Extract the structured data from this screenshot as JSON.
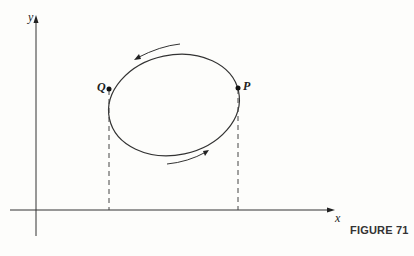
{
  "figure": {
    "caption": "FIGURE 71",
    "axes": {
      "x_label": "x",
      "y_label": "y"
    },
    "points": [
      {
        "name": "P",
        "label": "P"
      },
      {
        "name": "Q",
        "label": "Q"
      }
    ],
    "curve": "closed ellipse-like loop traversed counterclockwise",
    "annotations": [
      "arrow along top (leftward)",
      "arrow along bottom (rightward)",
      "dashed vertical line from Q to x-axis",
      "dashed vertical line from P to x-axis"
    ],
    "colors": {
      "ink": "#222222",
      "background": "#fdfdfb"
    }
  }
}
